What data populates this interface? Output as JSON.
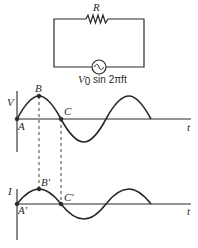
{
  "circuit": {
    "resistor_label": "R",
    "source_label": {
      "prefix": "V",
      "subscript": "0",
      "expression": " sin 2πft"
    }
  },
  "voltage_plot": {
    "y_label": "V",
    "x_label": "t",
    "points": {
      "A": "A",
      "B": "B",
      "C": "C"
    }
  },
  "current_plot": {
    "y_label": "I",
    "x_label": "t",
    "points": {
      "A": "A′",
      "B": "B′",
      "C": "C′"
    }
  },
  "colors": {
    "line": "#2a2a2a",
    "background": "#ffffff"
  }
}
